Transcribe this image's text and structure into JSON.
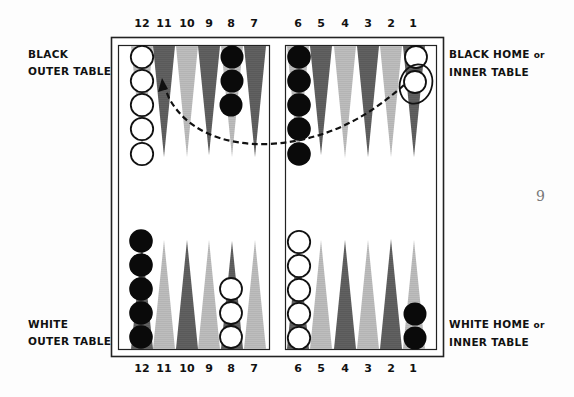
{
  "labels": {
    "black_outer": [
      "BLACK",
      "OUTER TABLE"
    ],
    "black_home": {
      "line1_main": "BLACK HOME",
      "line1_small": "or",
      "line2": "INNER TABLE"
    },
    "white_outer": [
      "WHITE",
      "OUTER TABLE"
    ],
    "white_home": {
      "line1_main": "WHITE HOME",
      "line1_small": "or",
      "line2": "INNER TABLE"
    }
  },
  "top_numbers": [
    "12",
    "11",
    "10",
    "9",
    "8",
    "7",
    "6",
    "5",
    "4",
    "3",
    "2",
    "1"
  ],
  "bottom_numbers": [
    "12",
    "11",
    "10",
    "9",
    "8",
    "7",
    "6",
    "5",
    "4",
    "3",
    "2",
    "1"
  ],
  "page_number": "9",
  "colors": {
    "dark_point": "#5a5a5a",
    "light_point": "#b4b4b4",
    "board_line": "#222222",
    "black_checker": "#0a0a0a",
    "white_checker": "#ffffff"
  },
  "checkers": {
    "top": [
      {
        "point": "12",
        "color": "white",
        "count": 5
      },
      {
        "point": "8",
        "color": "black",
        "count": 3
      },
      {
        "point": "6",
        "color": "black",
        "count": 5
      },
      {
        "point": "1",
        "color": "white",
        "count": 2,
        "highlighted_index": 2
      }
    ],
    "bottom": [
      {
        "point": "12",
        "color": "black",
        "count": 5
      },
      {
        "point": "8",
        "color": "white",
        "count": 3
      },
      {
        "point": "6",
        "color": "white",
        "count": 5
      },
      {
        "point": "1",
        "color": "black",
        "count": 2
      }
    ]
  },
  "annotation": {
    "type": "dashed-arrow",
    "from_point": "1",
    "to_point": "11",
    "description": "move of circled white checker from black's 1-point to 11-point"
  }
}
